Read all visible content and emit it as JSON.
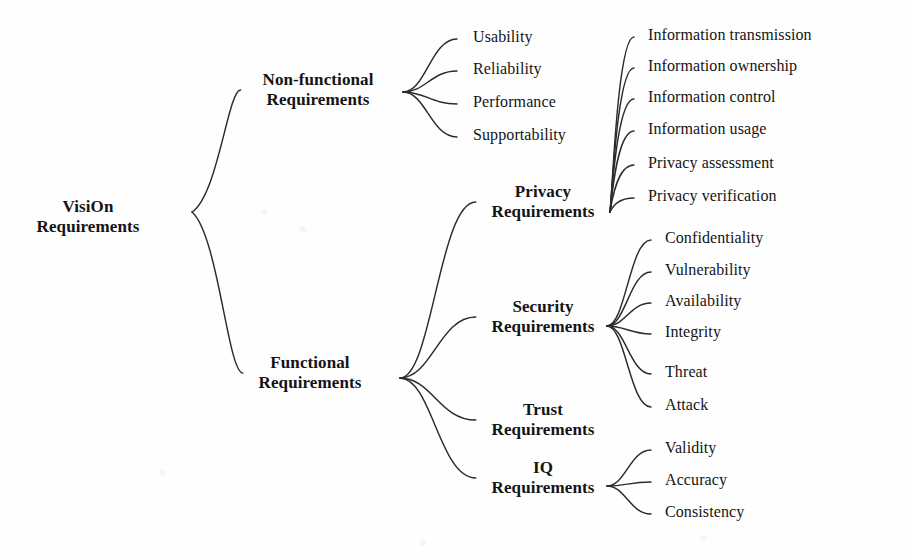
{
  "diagram": {
    "type": "mind-map",
    "background_color": "#fefefe",
    "text_color": "#141414",
    "edge_color": "#2b2b2b",
    "root": {
      "id": "visi-on-requirements",
      "lines": [
        "VisiOn",
        "Requirements"
      ],
      "x": 88,
      "y": 197,
      "font_size": 17,
      "bold": true
    },
    "branches": [
      {
        "id": "non-functional-requirements",
        "lines": [
          "Non-functional",
          "Requirements"
        ],
        "x": 318,
        "y": 70,
        "font_size": 17,
        "bold": true,
        "fan_origin": {
          "x": 403,
          "y": 92
        },
        "children": [
          {
            "id": "usability",
            "label": "Usability",
            "x": 473,
            "y": 28
          },
          {
            "id": "reliability",
            "label": "Reliability",
            "x": 473,
            "y": 60
          },
          {
            "id": "performance",
            "label": "Performance",
            "x": 473,
            "y": 93
          },
          {
            "id": "supportability",
            "label": "Supportability",
            "x": 473,
            "y": 126
          }
        ]
      },
      {
        "id": "functional-requirements",
        "lines": [
          "Functional",
          "Requirements"
        ],
        "x": 310,
        "y": 353,
        "font_size": 17,
        "bold": true,
        "fan_origin": {
          "x": 400,
          "y": 378
        },
        "children": [
          {
            "id": "privacy-requirements",
            "lines": [
              "Privacy",
              "Requirements"
            ],
            "x": 543,
            "y": 182,
            "font_size": 17,
            "bold": true,
            "fan_origin": {
              "x": 610,
              "y": 212
            },
            "children": [
              {
                "id": "information-transmission",
                "label": "Information transmission",
                "x": 648,
                "y": 26
              },
              {
                "id": "information-ownership",
                "label": "Information ownership",
                "x": 648,
                "y": 57
              },
              {
                "id": "information-control",
                "label": "Information control",
                "x": 648,
                "y": 88
              },
              {
                "id": "information-usage",
                "label": "Information usage",
                "x": 648,
                "y": 120
              },
              {
                "id": "privacy-assessment",
                "label": "Privacy assessment",
                "x": 648,
                "y": 154
              },
              {
                "id": "privacy-verification",
                "label": "Privacy verification",
                "x": 648,
                "y": 187
              }
            ]
          },
          {
            "id": "security-requirements",
            "lines": [
              "Security",
              "Requirements"
            ],
            "x": 543,
            "y": 297,
            "font_size": 17,
            "bold": true,
            "fan_origin": {
              "x": 607,
              "y": 326
            },
            "children": [
              {
                "id": "confidentiality",
                "label": "Confidentiality",
                "x": 665,
                "y": 229
              },
              {
                "id": "vulnerability",
                "label": "Vulnerability",
                "x": 665,
                "y": 261
              },
              {
                "id": "availability",
                "label": "Availability",
                "x": 665,
                "y": 292
              },
              {
                "id": "integrity",
                "label": "Integrity",
                "x": 665,
                "y": 323
              },
              {
                "id": "threat",
                "label": "Threat",
                "x": 665,
                "y": 363
              },
              {
                "id": "attack",
                "label": "Attack",
                "x": 665,
                "y": 396
              }
            ]
          },
          {
            "id": "trust-requirements",
            "lines": [
              "Trust",
              "Requirements"
            ],
            "x": 543,
            "y": 400,
            "font_size": 17,
            "bold": true,
            "children": []
          },
          {
            "id": "iq-requirements",
            "lines": [
              "IQ",
              "Requirements"
            ],
            "x": 543,
            "y": 458,
            "font_size": 17,
            "bold": true,
            "fan_origin": {
              "x": 607,
              "y": 486
            },
            "children": [
              {
                "id": "validity",
                "label": "Validity",
                "x": 665,
                "y": 439
              },
              {
                "id": "accuracy",
                "label": "Accuracy",
                "x": 665,
                "y": 471
              },
              {
                "id": "consistency",
                "label": "Consistency",
                "x": 665,
                "y": 503
              }
            ]
          }
        ]
      }
    ]
  }
}
